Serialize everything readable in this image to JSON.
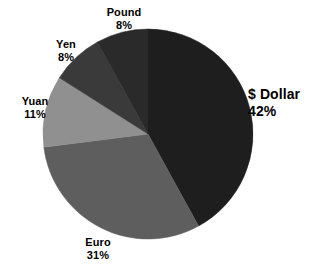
{
  "chart_data": {
    "type": "pie",
    "title": "",
    "subtitle": "",
    "xlabel": "",
    "ylabel": "",
    "grid": false,
    "legend": "none",
    "labels_position": "outside",
    "start_angle_deg": 0,
    "direction": "clockwise",
    "background": "#ffffff",
    "center": {
      "x": 148,
      "y": 134
    },
    "radius": 105,
    "categories": [
      "$ Dollar",
      "Euro",
      "Yuan",
      "Yen",
      "Pound"
    ],
    "values": [
      42,
      31,
      11,
      8,
      8
    ],
    "value_suffix": "%",
    "colors": [
      "#1e1e1e",
      "#5e5e5e",
      "#909090",
      "#3a3a3a",
      "#2a2a2a"
    ],
    "slices": [
      {
        "name": "dollar",
        "label": "$ Dollar",
        "percent_text": "42%",
        "value": 42,
        "color": "#1e1e1e",
        "start_deg": 0,
        "end_deg": 151.2
      },
      {
        "name": "euro",
        "label": "Euro",
        "percent_text": "31%",
        "value": 31,
        "color": "#5e5e5e",
        "start_deg": 151.2,
        "end_deg": 262.8
      },
      {
        "name": "yuan",
        "label": "Yuan",
        "percent_text": "11%",
        "value": 11,
        "color": "#909090",
        "start_deg": 262.8,
        "end_deg": 302.4
      },
      {
        "name": "yen",
        "label": "Yen",
        "percent_text": "8%",
        "value": 8,
        "color": "#3a3a3a",
        "start_deg": 302.4,
        "end_deg": 331.2
      },
      {
        "name": "pound",
        "label": "Pound",
        "percent_text": "8%",
        "value": 8,
        "color": "#2a2a2a",
        "start_deg": 331.2,
        "end_deg": 360
      }
    ]
  }
}
